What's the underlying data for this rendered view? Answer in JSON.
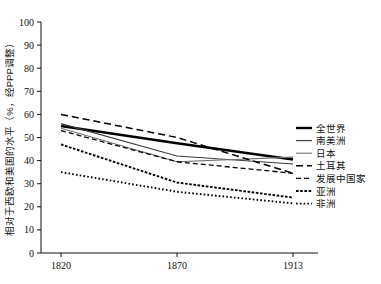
{
  "chart_data": {
    "type": "line",
    "title": "",
    "xlabel": "",
    "ylabel": "相对于西欧和美国的水平（%，经PPP调整）",
    "x": [
      "1820",
      "1870",
      "1913"
    ],
    "xlim": [
      1820,
      1913
    ],
    "ylim": [
      0,
      100
    ],
    "yticks": [
      "0",
      "10",
      "20",
      "30",
      "40",
      "50",
      "60",
      "70",
      "80",
      "90",
      "100"
    ],
    "xticks": [
      "1820",
      "1870",
      "1913"
    ],
    "grid": false,
    "legend_position": "right",
    "series": [
      {
        "name": "全世界",
        "values": [
          55,
          47.5,
          40.5
        ],
        "style": "solid-thick",
        "color": "#000000"
      },
      {
        "name": "南美洲",
        "values": [
          56,
          42,
          38.5
        ],
        "style": "solid-thin",
        "color": "#3a3a3a"
      },
      {
        "name": "日本",
        "values": [
          54,
          39.5,
          41.5
        ],
        "style": "solid-thin",
        "color": "#6e6e6e"
      },
      {
        "name": "土耳其",
        "values": [
          60,
          50,
          34.5
        ],
        "style": "dashed-long",
        "color": "#000000"
      },
      {
        "name": "发展中国家",
        "values": [
          53,
          39.5,
          34.5
        ],
        "style": "dashed",
        "color": "#000000"
      },
      {
        "name": "亚洲",
        "values": [
          47,
          30.5,
          24
        ],
        "style": "dotted-dash",
        "color": "#000000"
      },
      {
        "name": "非洲",
        "values": [
          35,
          26.5,
          21.5
        ],
        "style": "dotted",
        "color": "#000000"
      }
    ]
  },
  "legend": {
    "items": [
      "全世界",
      "南美洲",
      "日本",
      "土耳其",
      "发展中国家",
      "亚洲",
      "非洲"
    ]
  },
  "axis": {
    "y_title": "相对于西欧和美国的水平（%，经PPP调整）",
    "y_ticks": [
      "100",
      "90",
      "80",
      "70",
      "60",
      "50",
      "40",
      "30",
      "20",
      "10",
      "0"
    ],
    "x_ticks": [
      "1820",
      "1870",
      "1913"
    ]
  }
}
